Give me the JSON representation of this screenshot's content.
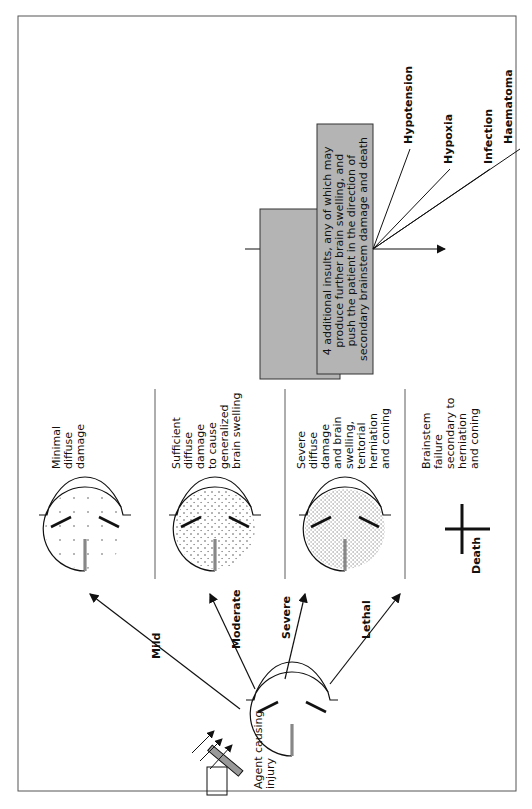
{
  "agent": {
    "label_lines": [
      "Agent causing",
      "injury"
    ]
  },
  "severity_paths": [
    {
      "label": "Mild",
      "outcome_lines": [
        "Minimal",
        "diffuse",
        "damage"
      ]
    },
    {
      "label": "Moderate",
      "outcome_lines": [
        "Sufficient",
        "diffuse",
        "damage",
        "to cause",
        "generalized",
        "brain swelling"
      ]
    },
    {
      "label": "Severe",
      "outcome_lines": [
        "Severe",
        "diffuse",
        "damage",
        "and brain",
        "swelling,",
        "tentorial",
        "herniation",
        "and coning"
      ]
    },
    {
      "label": "Lethal",
      "outcome_lines": [
        "Brainstem",
        "failure",
        "secondary to",
        "herniation",
        "and coning"
      ]
    }
  ],
  "death_label": "Death",
  "insults": {
    "box_lines": [
      "4 additional insults, any of which may",
      "produce further brain swelling, and",
      "push the patient in the direction of",
      "secondary brainstem damage and death"
    ],
    "items": [
      "Hypotension",
      "Hypoxia",
      "Infection",
      "Haematoma"
    ],
    "box_color": "#b4b4b4"
  }
}
